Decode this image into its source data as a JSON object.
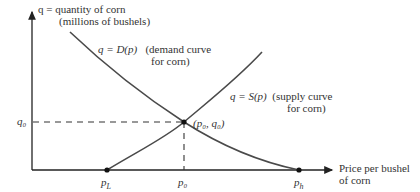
{
  "diagram": {
    "type": "supply-demand",
    "y_axis": {
      "line1": "q = quantity of corn",
      "line2": "(millions of bushels)"
    },
    "x_axis": {
      "line1": "Price per bushel",
      "line2": "of corn"
    },
    "demand": {
      "equation": "q = D(p)",
      "desc1": "(demand curve",
      "desc2": "for corn)"
    },
    "supply": {
      "equation": "q = S(p)",
      "desc1": "(supply curve",
      "desc2": "for corn)"
    },
    "equilibrium": {
      "label": "(p₀, q₀)"
    },
    "ticks": {
      "q0": "q₀",
      "pL": "p",
      "pL_sub": "L",
      "p0": "p₀",
      "ph": "p",
      "ph_sub": "h"
    },
    "colors": {
      "line": "#333333",
      "curve": "#4a4a4a"
    }
  }
}
